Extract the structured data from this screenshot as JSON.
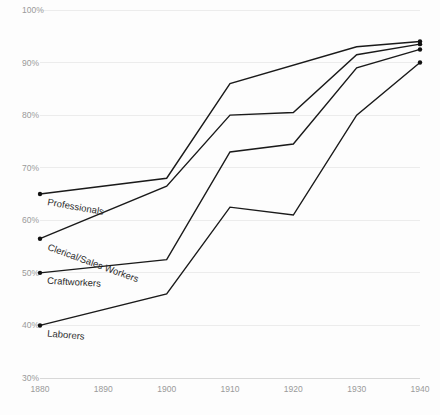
{
  "chart_data": {
    "type": "line",
    "title": "",
    "subtitle": "",
    "xlabel": "",
    "ylabel": "",
    "x": [
      1880,
      1890,
      1900,
      1910,
      1920,
      1930,
      1940
    ],
    "xtick_labels": [
      "1880",
      "1890",
      "1900",
      "1910",
      "1920",
      "1930",
      "1940"
    ],
    "ytick_labels": [
      "100%",
      "90%",
      "80%",
      "70%",
      "60%",
      "50%",
      "40%",
      "30%"
    ],
    "ytick_values": [
      100,
      90,
      80,
      70,
      60,
      50,
      40,
      30
    ],
    "xlim": [
      1880,
      1940
    ],
    "ylim": [
      30,
      100
    ],
    "grid": true,
    "legend": "inline-labels",
    "line_color": "#1a1a1a",
    "grid_color": "#ececec",
    "tick_color": "#9a9a9a",
    "background": "#fdfdfd",
    "series": [
      {
        "name": "Professionals",
        "x": [
          1880,
          1900,
          1910,
          1930,
          1940
        ],
        "values": [
          65,
          68,
          86,
          93,
          94
        ],
        "label_anchor_x": 1880,
        "label_anchor_y": 65,
        "label_rotation": -10
      },
      {
        "name": "Clerical/Sales Workers",
        "x": [
          1880,
          1900,
          1910,
          1920,
          1930,
          1940
        ],
        "values": [
          56.5,
          66.5,
          80,
          80.5,
          91.5,
          93.5
        ],
        "label_anchor_x": 1880,
        "label_anchor_y": 56.5,
        "label_rotation": -20
      },
      {
        "name": "Craftworkers",
        "x": [
          1880,
          1900,
          1910,
          1920,
          1930,
          1940
        ],
        "values": [
          50,
          52.5,
          73,
          74.5,
          89,
          92.5
        ],
        "label_anchor_x": 1880,
        "label_anchor_y": 50,
        "label_rotation": -3
      },
      {
        "name": "Laborers",
        "x": [
          1880,
          1900,
          1910,
          1920,
          1930,
          1940
        ],
        "values": [
          40,
          46,
          62.5,
          61,
          80,
          90
        ],
        "label_anchor_x": 1880,
        "label_anchor_y": 40,
        "label_rotation": -5
      }
    ]
  }
}
